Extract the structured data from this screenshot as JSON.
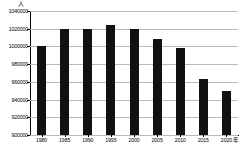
{
  "chart_data": {
    "type": "bar",
    "title": "",
    "xlabel": "年",
    "ylabel": "人",
    "categories": [
      "1980",
      "1985",
      "1990",
      "1995",
      "2000",
      "2005",
      "2010",
      "2015",
      "2020"
    ],
    "values": [
      1000000,
      1020000,
      1020000,
      1024000,
      1020000,
      1008000,
      998000,
      963000,
      950000
    ],
    "ylim": [
      900000,
      1040000
    ],
    "ytick_labels": [
      "1040000",
      "1020000",
      "1000000",
      "980000",
      "960000",
      "940000",
      "920000",
      "900000"
    ],
    "ytick_values": [
      1040000,
      1020000,
      1000000,
      980000,
      960000,
      940000,
      920000,
      900000
    ],
    "grid": true,
    "legend": "none",
    "bar_color": "#111111",
    "grid_color": "#b9b9b9",
    "axis_color": "#000000"
  },
  "axes": {
    "y_unit_label": "人",
    "x_unit_label": "年"
  }
}
